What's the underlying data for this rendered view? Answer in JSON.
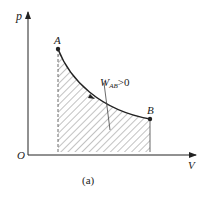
{
  "diagram": {
    "type": "p-V diagram",
    "axes": {
      "y_label": "p",
      "x_label": "V",
      "origin_label": "O"
    },
    "points": [
      {
        "label": "A",
        "x": 58,
        "y": 49
      },
      {
        "label": "B",
        "x": 150,
        "y": 119
      }
    ],
    "curve": "A to B expansion (decreasing p with increasing V), arrow pointing from A to B",
    "shaded_region": "hatched area under curve AB down to V axis",
    "annotation": {
      "main": "W",
      "sub": "AB",
      "rest": ">0"
    },
    "caption": "(a)",
    "colors": {
      "line": "#222222",
      "hatch": "#555555",
      "background": "#ffffff"
    }
  }
}
